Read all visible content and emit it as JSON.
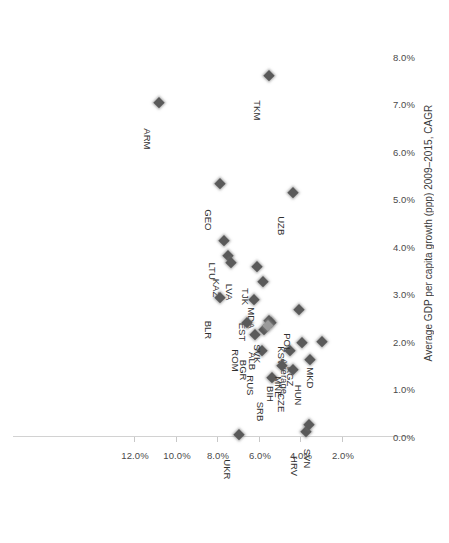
{
  "chart_data": {
    "type": "scatter",
    "title": "",
    "subtitle": "",
    "xlabel": "",
    "ylabel": "Average GDP per capita growth (ppp) 2009–2015, CAGR",
    "xlim": [
      1.2,
      13.0
    ],
    "ylim": [
      0.0,
      8.6
    ],
    "xticks": [
      "2.0%",
      "4.0%",
      "6.0%",
      "8.0%",
      "10.0%",
      "12.0%"
    ],
    "xtick_values": [
      2.0,
      4.0,
      6.0,
      8.0,
      10.0,
      12.0
    ],
    "yticks": [
      "0.0%",
      "1.0%",
      "2.0%",
      "3.0%",
      "4.0%",
      "5.0%",
      "6.0%",
      "7.0%",
      "8.0%"
    ],
    "ytick_values": [
      0.0,
      1.0,
      2.0,
      3.0,
      4.0,
      5.0,
      6.0,
      7.0,
      8.0
    ],
    "grid": false,
    "legend": "none",
    "marker": "diamond",
    "marker_color": "#5a5a5a",
    "average_marker_color": "#9a9a9a",
    "axis_color": "#d2d2d2",
    "points": [
      {
        "label": "ARM",
        "x": 10.85,
        "y": 7.03,
        "lx": 6,
        "ly": -4,
        "avg": false
      },
      {
        "label": "TKM",
        "x": 5.58,
        "y": 7.6,
        "lx": 6,
        "ly": -4,
        "avg": false
      },
      {
        "label": "GEO",
        "x": 7.95,
        "y": 5.33,
        "lx": 6,
        "ly": -4,
        "avg": false
      },
      {
        "label": "LTU",
        "x": 7.75,
        "y": 4.13,
        "lx": 6,
        "ly": -4,
        "avg": false
      },
      {
        "label": "UZB",
        "x": 4.43,
        "y": 5.14,
        "lx": 6,
        "ly": -4,
        "avg": false
      },
      {
        "label": "TJK",
        "x": 6.15,
        "y": 3.58,
        "lx": 6,
        "ly": -4,
        "avg": false
      },
      {
        "label": "MDA",
        "x": 5.85,
        "y": 3.26,
        "lx": 6,
        "ly": -4,
        "avg": false
      },
      {
        "label": "KAZ",
        "x": 7.55,
        "y": 3.8,
        "lx": 6,
        "ly": -4,
        "avg": false
      },
      {
        "label": "LVA",
        "x": 7.4,
        "y": 3.66,
        "lx": -4,
        "ly": -4,
        "avg": false
      },
      {
        "label": "BLR",
        "x": 7.95,
        "y": 2.92,
        "lx": 6,
        "ly": -4,
        "avg": false
      },
      {
        "label": "EST",
        "x": 6.3,
        "y": 2.88,
        "lx": 6,
        "ly": -4,
        "avg": false
      },
      {
        "label": "ROM",
        "x": 6.65,
        "y": 2.4,
        "lx": 6,
        "ly": -4,
        "avg": false
      },
      {
        "label": "BGR",
        "x": 6.25,
        "y": 2.14,
        "lx": 6,
        "ly": -4,
        "avg": false
      },
      {
        "label": "RUS",
        "x": 5.9,
        "y": 1.82,
        "lx": 6,
        "ly": -4,
        "avg": false
      },
      {
        "label": "SVK",
        "x": 5.55,
        "y": 2.44,
        "lx": 6,
        "ly": -4,
        "avg": false
      },
      {
        "label": "ALB",
        "x": 5.8,
        "y": 2.26,
        "lx": 6,
        "ly": -4,
        "avg": false
      },
      {
        "label": "KSV",
        "x": 5.45,
        "y": 2.4,
        "lx": -16,
        "ly": -4,
        "avg": false
      },
      {
        "label": "Average",
        "x": 5.62,
        "y": 2.34,
        "lx": -22,
        "ly": 3,
        "avg": true
      },
      {
        "label": "SRB",
        "x": 5.4,
        "y": 1.24,
        "lx": 6,
        "ly": -4,
        "avg": false
      },
      {
        "label": "BIH",
        "x": 4.95,
        "y": 1.5,
        "lx": 6,
        "ly": -4,
        "avg": false
      },
      {
        "label": "MNE",
        "x": 4.55,
        "y": 1.8,
        "lx": 6,
        "ly": -4,
        "avg": false
      },
      {
        "label": "POL",
        "x": 4.12,
        "y": 2.68,
        "lx": 6,
        "ly": -4,
        "avg": false
      },
      {
        "label": "KGZ",
        "x": 3.98,
        "y": 1.98,
        "lx": 6,
        "ly": -4,
        "avg": false
      },
      {
        "label": "CZE",
        "x": 4.42,
        "y": 1.42,
        "lx": 6,
        "ly": -4,
        "avg": false
      },
      {
        "label": "HUN",
        "x": 3.58,
        "y": 1.62,
        "lx": 6,
        "ly": -4,
        "avg": false
      },
      {
        "label": "MKD",
        "x": 3.0,
        "y": 2.0,
        "lx": 6,
        "ly": -4,
        "avg": false
      },
      {
        "label": "HRV",
        "x": 3.8,
        "y": 0.1,
        "lx": 6,
        "ly": -4,
        "avg": false
      },
      {
        "label": "SVN",
        "x": 3.62,
        "y": 0.26,
        "lx": -4,
        "ly": -4,
        "avg": false
      },
      {
        "label": "UKR",
        "x": 7.0,
        "y": 0.05,
        "lx": 6,
        "ly": -4,
        "avg": false
      }
    ]
  }
}
